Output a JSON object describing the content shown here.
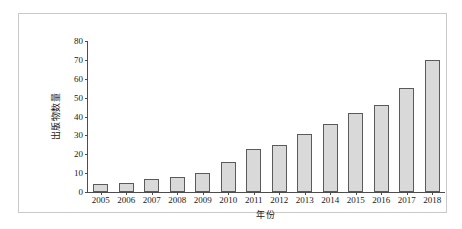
{
  "chart_data": {
    "type": "bar",
    "title": "",
    "subtitle": "",
    "xlabel": "年份",
    "ylabel": "出版物数量",
    "categories": [
      "2005",
      "2006",
      "2007",
      "2008",
      "2009",
      "2010",
      "2011",
      "2012",
      "2013",
      "2014",
      "2015",
      "2016",
      "2017",
      "2018"
    ],
    "values": [
      4,
      5,
      7,
      8,
      10,
      16,
      23,
      25,
      31,
      36,
      42,
      46,
      55,
      70
    ],
    "ylim": [
      0,
      80
    ],
    "ytick_labels": [
      "0",
      "10",
      "20",
      "30",
      "40",
      "50",
      "60",
      "70",
      "80"
    ],
    "ytick_values": [
      0,
      10,
      20,
      30,
      40,
      50,
      60,
      70,
      80
    ],
    "grid": false,
    "legend": "none",
    "bar_fill_color": "#d9d9d9",
    "bar_border_color": "#5a5a5a",
    "axis_color": "#4d4d4d",
    "frame_color": "#c9c9c9",
    "background_color": "#ffffff"
  }
}
